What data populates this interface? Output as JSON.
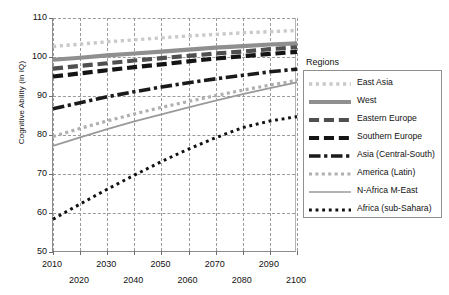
{
  "chart_data": {
    "type": "line",
    "title": "",
    "xlabel": "",
    "ylabel": "Cognitive Ability (in IQ)",
    "xlim": [
      2010,
      2100
    ],
    "ylim": [
      50,
      110
    ],
    "grid": true,
    "legend_position": "right",
    "legend_title": "Regions",
    "y_ticks": [
      110,
      100,
      90,
      80,
      70,
      60,
      50
    ],
    "x_ticks": [
      2010,
      2020,
      2030,
      2040,
      2050,
      2060,
      2070,
      2080,
      2090,
      2100
    ],
    "x_ticks_top_row": [
      2010,
      2030,
      2050,
      2070,
      2090
    ],
    "x_ticks_bottom_row": [
      2020,
      2040,
      2060,
      2080,
      2100
    ],
    "x": [
      2010,
      2020,
      2030,
      2040,
      2050,
      2060,
      2070,
      2080,
      2090,
      2100
    ],
    "series": [
      {
        "name": "East Asia",
        "color": "#c9c9c9",
        "style": "dotted",
        "width": 3.4,
        "values": [
          102.7,
          103.3,
          103.9,
          104.4,
          104.9,
          105.4,
          105.8,
          106.2,
          106.5,
          106.8
        ]
      },
      {
        "name": "West",
        "color": "#8f8f8f",
        "style": "solid-thick",
        "width": 4.2,
        "values": [
          99.3,
          99.8,
          100.4,
          100.9,
          101.4,
          101.9,
          102.4,
          102.8,
          103.2,
          103.5
        ]
      },
      {
        "name": "Eastern Europe",
        "color": "#4f4f4f",
        "style": "dashed",
        "width": 4.2,
        "values": [
          97.0,
          97.7,
          98.4,
          99.1,
          99.7,
          100.3,
          100.9,
          101.4,
          102.0,
          102.5
        ]
      },
      {
        "name": "Southern Europe",
        "color": "#141414",
        "style": "dashed",
        "width": 4.2,
        "values": [
          95.0,
          95.8,
          96.6,
          97.4,
          98.1,
          98.9,
          99.6,
          100.2,
          100.8,
          101.3
        ]
      },
      {
        "name": "Asia (Central-South)",
        "color": "#1a1a1a",
        "style": "dash-dot",
        "width": 3.6,
        "values": [
          86.7,
          88.3,
          89.8,
          91.1,
          92.3,
          93.4,
          94.4,
          95.3,
          96.2,
          96.9
        ]
      },
      {
        "name": "America (Latin)",
        "color": "#b0b0b0",
        "style": "dotted",
        "width": 3.2,
        "values": [
          79.6,
          81.7,
          83.6,
          85.4,
          87.1,
          88.6,
          90.1,
          91.5,
          92.8,
          94.0
        ]
      },
      {
        "name": "N-Africa M-East",
        "color": "#9a9a9a",
        "style": "solid-thin",
        "width": 1.7,
        "values": [
          77.2,
          79.4,
          81.5,
          83.5,
          85.3,
          87.1,
          88.8,
          90.5,
          92.0,
          93.5
        ]
      },
      {
        "name": "Africa (sub-Sahara)",
        "color": "#111111",
        "style": "square-dots",
        "width": 3.0,
        "values": [
          58.4,
          62.3,
          66.1,
          69.7,
          73.2,
          76.4,
          79.3,
          81.9,
          83.6,
          84.7
        ]
      }
    ]
  },
  "legend": {
    "title": "Regions",
    "items": [
      {
        "label": "East Asia"
      },
      {
        "label": "West"
      },
      {
        "label": "Eastern Europe"
      },
      {
        "label": "Southern Europe"
      },
      {
        "label": "Asia (Central-South)"
      },
      {
        "label": "America (Latin)"
      },
      {
        "label": "N-Africa M-East"
      },
      {
        "label": "Africa (sub-Sahara)"
      }
    ]
  },
  "axes": {
    "y_title": "Cognitive Ability (in IQ)"
  }
}
